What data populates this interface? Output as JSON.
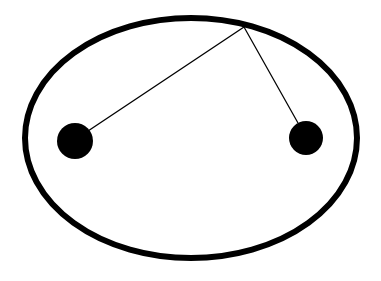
{
  "diagram": {
    "type": "ellipse-foci",
    "background": "#ffffff",
    "stroke_color": "#000000",
    "ellipse": {
      "cx": 191,
      "cy": 138,
      "rx": 166,
      "ry": 120,
      "stroke_width": 6
    },
    "foci": [
      {
        "name": "left-focus",
        "cx": 75,
        "cy": 141,
        "r": 18
      },
      {
        "name": "right-focus",
        "cx": 306,
        "cy": 138,
        "r": 17
      }
    ],
    "point_on_ellipse": {
      "x": 244,
      "y": 27
    },
    "lines": [
      {
        "name": "line-to-left-focus",
        "x1": 244,
        "y1": 27,
        "x2": 88,
        "y2": 131,
        "stroke_width": 1.3
      },
      {
        "name": "line-to-right-focus",
        "x1": 244,
        "y1": 27,
        "x2": 298,
        "y2": 123,
        "stroke_width": 1.3
      }
    ]
  }
}
